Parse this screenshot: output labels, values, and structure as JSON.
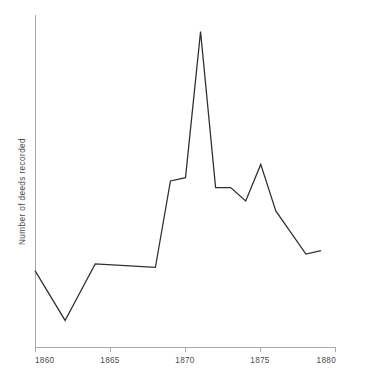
{
  "chart_data": {
    "type": "line",
    "title": "",
    "subtitle": "",
    "xlabel": "",
    "ylabel": "Number of deeds recorded",
    "xlim": [
      1860,
      1880
    ],
    "ylim": [
      0,
      100
    ],
    "grid": false,
    "legend": null,
    "xticks": [
      1860,
      1865,
      1870,
      1875,
      1880
    ],
    "xtick_labels": [
      "1860",
      "1865",
      "1870",
      "1875",
      "1880"
    ],
    "yticks": [],
    "ytick_labels": [],
    "series": [
      {
        "name": "Number of deeds recorded",
        "color": "#2e2e2e",
        "x": [
          1860,
          1862,
          1864,
          1868,
          1869,
          1870,
          1871,
          1872,
          1873,
          1874,
          1875,
          1876,
          1878,
          1879
        ],
        "y": [
          23,
          8,
          25,
          24,
          50,
          51,
          95,
          48,
          48,
          44,
          55,
          41,
          28,
          29
        ]
      }
    ],
    "annotations": []
  },
  "axes": {
    "x_axis_name": "year-axis",
    "y_axis_name": "count-axis"
  }
}
